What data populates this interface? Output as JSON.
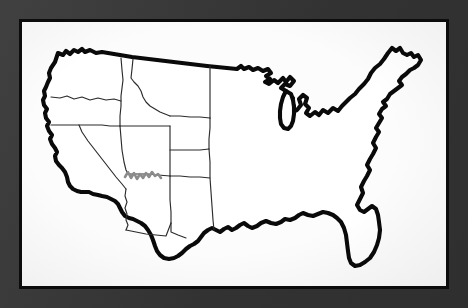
{
  "image": {
    "kind": "photograph-of-printed-map",
    "title": "Blank outline map of the contiguous United States",
    "subject": "United States (lower 48)",
    "width_px": 468,
    "height_px": 308
  },
  "frame": {
    "matte_color": "#383838",
    "inner_rule_color": "#0c0c0c",
    "paper_color": "#ffffff",
    "matte_width_px": 19,
    "inner_rule_width_px": 3
  },
  "map": {
    "outline_color": "#0a0a0a",
    "outline_weight_px": 4,
    "state_border_color": "#2b2b2b",
    "state_border_weight_px": 1,
    "annotation_color": "#8c8c8c",
    "fill_color": "#ffffff",
    "labels_present": false,
    "legend_present": false,
    "scale_bar_present": false,
    "compass_present": false,
    "graticule_present": false
  },
  "features": {
    "national_outline": "contiguous-us-coastline",
    "northern_border": "united-states-canada-border",
    "southern_border": "united-states-mexico-border",
    "great_lakes": [
      "Lake Superior",
      "Lake Michigan",
      "Lake Huron",
      "Lake Erie",
      "Lake Ontario"
    ],
    "peninsulas": [
      "Florida",
      "Lower Michigan",
      "Upper Michigan",
      "Cape Cod",
      "Delmarva"
    ],
    "coastlines": [
      "Pacific",
      "Atlantic",
      "Gulf of Mexico"
    ]
  },
  "states_outlined": [
    {
      "name": "Washington",
      "region": "Pacific Northwest"
    },
    {
      "name": "Oregon",
      "region": "Pacific Northwest"
    },
    {
      "name": "Idaho",
      "region": "Mountain West"
    },
    {
      "name": "Montana",
      "region": "Mountain West"
    },
    {
      "name": "Wyoming",
      "region": "Mountain West"
    },
    {
      "name": "California",
      "region": "Pacific"
    },
    {
      "name": "Nevada",
      "region": "Great Basin"
    },
    {
      "name": "Utah",
      "region": "Great Basin"
    },
    {
      "name": "Arizona",
      "region": "Southwest"
    },
    {
      "name": "Colorado",
      "region": "Mountain West"
    },
    {
      "name": "New Mexico",
      "region": "Southwest"
    }
  ],
  "annotations": [
    {
      "name": "grand-canyon-sketch",
      "style": "gray-zigzag-line",
      "color": "#8c8c8c",
      "location": "northern Arizona / southern Utah border",
      "description": "short hand-drawn gray squiggle marking the Grand Canyon"
    }
  ]
}
